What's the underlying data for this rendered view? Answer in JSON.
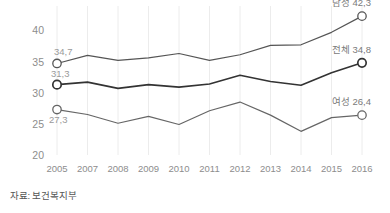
{
  "chart_data": {
    "type": "line",
    "title": "",
    "xlabel": "",
    "ylabel": "",
    "x": [
      "2005",
      "2007",
      "2008",
      "2009",
      "2010",
      "2011",
      "2012",
      "2013",
      "2014",
      "2015",
      "2016"
    ],
    "categories": [
      "2005",
      "2007",
      "2008",
      "2009",
      "2010",
      "2011",
      "2012",
      "2013",
      "2014",
      "2015",
      "2016"
    ],
    "ylim": [
      20,
      42
    ],
    "yticks": [
      20,
      25,
      30,
      35,
      40
    ],
    "ytick_labels": [
      "20",
      "25",
      "30",
      "35",
      "40"
    ],
    "grid": "vertical-only",
    "legend": "inline-end-labels",
    "series": [
      {
        "name": "남성",
        "label_end": "남성 42,3",
        "end_value": 42.3,
        "color": "#555555",
        "values": [
          34.7,
          36.0,
          35.2,
          35.6,
          36.3,
          35.2,
          36.1,
          37.6,
          37.7,
          39.7,
          42.3
        ]
      },
      {
        "name": "전체",
        "label_start": "31,3",
        "label_end": "전체 34,8",
        "start_value": 31.3,
        "end_value": 34.8,
        "color": "#333333",
        "values": [
          31.3,
          31.7,
          30.7,
          31.3,
          30.9,
          31.4,
          32.8,
          31.8,
          31.2,
          33.2,
          34.8
        ]
      },
      {
        "name": "여성",
        "label_start": "27,3",
        "label_end": "여성 26,4",
        "start_value": 27.3,
        "end_value": 26.4,
        "color": "#666666",
        "values": [
          27.3,
          26.5,
          25.1,
          26.2,
          24.9,
          27.1,
          28.5,
          26.4,
          23.8,
          26.0,
          26.4
        ]
      }
    ],
    "start_labels": {
      "male": "34,7",
      "total": "31,3",
      "female": "27,3"
    }
  },
  "footer": {
    "source": "자료: 보건복지부"
  },
  "axis": {
    "y_ticks": [
      "40",
      "35",
      "30",
      "25",
      "20"
    ],
    "x_ticks": [
      "2005",
      "2007",
      "2008",
      "2009",
      "2010",
      "2011",
      "2012",
      "2013",
      "2014",
      "2015",
      "2016"
    ]
  },
  "colors": {
    "male_line": "#555555",
    "total_line": "#333333",
    "female_line": "#666666",
    "grid": "#ececec",
    "tick_text": "#8d8d8d",
    "label_text": "#7a7a7a",
    "source_text": "#555555",
    "background": "#ffffff"
  }
}
